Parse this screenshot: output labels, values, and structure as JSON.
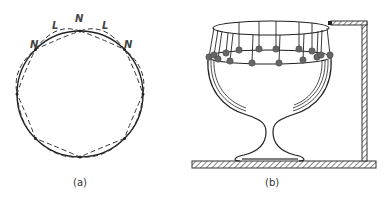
{
  "figure": {
    "panel_a": {
      "caption": "(a)",
      "labels": [
        {
          "text": "N",
          "x": 36,
          "y": 45
        },
        {
          "text": "L",
          "x": 55,
          "y": 27
        },
        {
          "text": "N",
          "x": 80,
          "y": 20
        },
        {
          "text": "L",
          "x": 105,
          "y": 27
        },
        {
          "text": "N",
          "x": 128,
          "y": 45
        }
      ],
      "description": "Circular ring with standing-wave deformation: solid circle plus two dashed antiphase deformed shapes; 8 nodes (N) and loops (L)"
    },
    "panel_b": {
      "caption": "(b)",
      "description": "Wine glass on a base plate with a ring of pendulum bobs suspended from an elliptical frame attached to a stand"
    },
    "colors": {
      "line": "#222222",
      "bob": "#666666",
      "hatch": "#555555"
    }
  }
}
